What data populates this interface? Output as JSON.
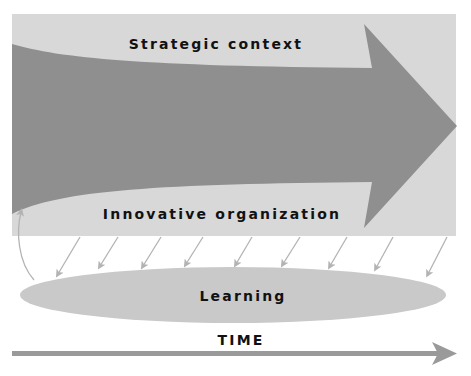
{
  "diagram": {
    "labels": {
      "strategic_context": "Strategic context",
      "innovative_organization": "Innovative organization",
      "learning": "Learning",
      "time": "TIME"
    },
    "colors": {
      "background_panel": "#d8d8d8",
      "main_arrow": "#8f8f8f",
      "learning_ellipse": "#c9c9c9",
      "small_arrows": "#b3b3b3",
      "time_arrow": "#9a9a9a",
      "text": "#111111"
    },
    "elements": {
      "main_arrow_direction": "right",
      "feedback_arrows_count": 9,
      "feedback_loop": "Learning back to Innovative organization"
    }
  }
}
